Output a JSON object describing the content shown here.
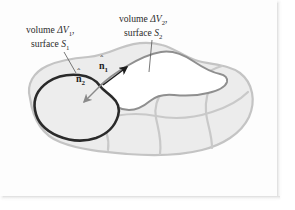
{
  "figure": {
    "type": "vector-calculus-diagram",
    "background_color": "#fdfdfd",
    "blob": {
      "fill_color": "#ececec",
      "cell_line_color": "#c9c9c9",
      "outline_color": "#c4c4c4"
    },
    "region_1": {
      "fill_color": "#ededed",
      "outline_color": "#2a2a2a",
      "label": {
        "line1_prefix": "volume ",
        "line1_delta": "Δ",
        "line1_var": "V",
        "line1_sub": "1",
        "line1_suffix": ",",
        "line2_prefix": "surface ",
        "line2_var": "S",
        "line2_sub": "1"
      }
    },
    "region_2": {
      "fill_color": "#ffffff",
      "outline_color": "#8f8f8f",
      "label": {
        "line1_prefix": "volume ",
        "line1_delta": "Δ",
        "line1_var": "V",
        "line1_sub": "2",
        "line1_suffix": ",",
        "line2_prefix": "surface ",
        "line2_var": "S",
        "line2_sub": "2"
      }
    },
    "normals": [
      {
        "name": "n-hat-1",
        "symbol": "n",
        "accent": "ˆ",
        "subscript": "1",
        "direction": "up-right",
        "from": [
          103,
          85
        ],
        "to": [
          128,
          66
        ],
        "color": "#1c1c1c"
      },
      {
        "name": "n-hat-2",
        "symbol": "n",
        "accent": "ˆ",
        "subscript": "2",
        "direction": "down-left",
        "from": [
          102,
          84
        ],
        "to": [
          83,
          103
        ],
        "color": "#8a8a8a"
      }
    ],
    "leader_lines": [
      {
        "name": "leader-to-region-1",
        "from": [
          64,
          52
        ],
        "to": [
          76,
          72
        ]
      },
      {
        "name": "leader-to-region-2",
        "from": [
          152,
          40
        ],
        "to": [
          149,
          72
        ]
      }
    ]
  }
}
